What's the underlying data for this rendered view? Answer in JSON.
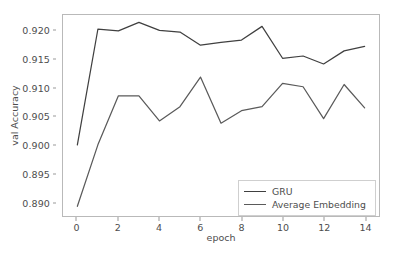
{
  "chart_data": {
    "type": "line",
    "title": "",
    "xlabel": "epoch",
    "ylabel": "val Accuracy",
    "x": [
      0,
      1,
      2,
      3,
      4,
      5,
      6,
      7,
      8,
      9,
      10,
      11,
      12,
      13,
      14
    ],
    "xlim": [
      -0.7,
      14.7
    ],
    "ylim": [
      0.8875,
      0.9228
    ],
    "xticks": [
      0,
      2,
      4,
      6,
      8,
      10,
      12,
      14
    ],
    "xtick_labels": [
      "0",
      "2",
      "4",
      "6",
      "8",
      "10",
      "12",
      "14"
    ],
    "yticks": [
      0.89,
      0.895,
      0.9,
      0.905,
      0.91,
      0.915,
      0.92
    ],
    "ytick_labels": [
      "0.890",
      "0.895",
      "0.900",
      "0.905",
      "0.910",
      "0.915",
      "0.920"
    ],
    "grid": false,
    "legend_position": "lower right",
    "series": [
      {
        "name": "GRU",
        "color": "#404040",
        "values": [
          0.9,
          0.9203,
          0.92,
          0.9215,
          0.9201,
          0.9198,
          0.9175,
          0.918,
          0.9184,
          0.9208,
          0.9152,
          0.9156,
          0.9142,
          0.9165,
          0.9173
        ]
      },
      {
        "name": "Average Embedding",
        "color": "#5a5a5a",
        "values": [
          0.8892,
          0.9,
          0.9086,
          0.9086,
          0.9042,
          0.9067,
          0.9119,
          0.9038,
          0.906,
          0.9067,
          0.9108,
          0.9102,
          0.9046,
          0.9106,
          0.9065
        ]
      }
    ]
  },
  "legend": {
    "entries": [
      {
        "label": "GRU"
      },
      {
        "label": "Average Embedding"
      }
    ]
  },
  "axes": {
    "x_label": "epoch",
    "y_label": "val Accuracy"
  },
  "style": {
    "background": "#ffffff",
    "spine_color": "#b9b9b9",
    "tick_color": "#9a9a9a",
    "text_color": "#4d4d4d"
  }
}
